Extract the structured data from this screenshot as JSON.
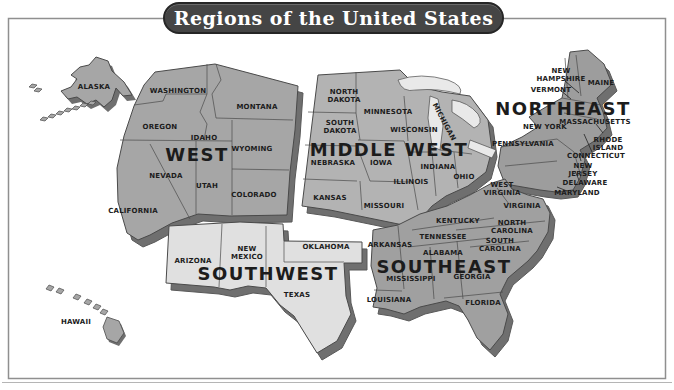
{
  "title": "Regions of the United States",
  "colors": {
    "background": "#ffffff",
    "frame_border": "#8f8f8f",
    "title_fill": "#454545",
    "title_text": "#ffffff",
    "extrusion": "#6f6f6f",
    "state_border": "#4a4a4a",
    "label_text": "#1c1c1c",
    "lake_fill": "#e9e9e9",
    "callout_line": "#222222"
  },
  "map": {
    "regions": [
      {
        "id": "west",
        "name": "WEST",
        "color": "#a6a6a6",
        "label": {
          "x": 197,
          "y": 154
        },
        "states": [
          {
            "name": "ALASKA",
            "x": 94,
            "y": 87
          },
          {
            "name": "WASHINGTON",
            "x": 178,
            "y": 91
          },
          {
            "name": "MONTANA",
            "x": 257,
            "y": 107
          },
          {
            "name": "OREGON",
            "x": 160,
            "y": 127
          },
          {
            "name": "IDAHO",
            "x": 204,
            "y": 138
          },
          {
            "name": "WYOMING",
            "x": 252,
            "y": 149
          },
          {
            "name": "NEVADA",
            "x": 166,
            "y": 176
          },
          {
            "name": "UTAH",
            "x": 207,
            "y": 186
          },
          {
            "name": "COLORADO",
            "x": 254,
            "y": 195
          },
          {
            "name": "CALIFORNIA",
            "x": 133,
            "y": 211
          },
          {
            "name": "HAWAII",
            "x": 76,
            "y": 322
          }
        ]
      },
      {
        "id": "middle_west",
        "name": "MIDDLE WEST",
        "color": "#b3b3b3",
        "label": {
          "x": 389,
          "y": 149
        },
        "states": [
          {
            "name": "NORTH\nDAKOTA",
            "x": 344,
            "y": 92
          },
          {
            "name": "MINNESOTA",
            "x": 388,
            "y": 112
          },
          {
            "name": "MICHIGAN",
            "x": 444,
            "y": 122,
            "rotate": 62
          },
          {
            "name": "SOUTH\nDAKOTA",
            "x": 340,
            "y": 123
          },
          {
            "name": "WISCONSIN",
            "x": 414,
            "y": 130
          },
          {
            "name": "NEBRASKA",
            "x": 333,
            "y": 163
          },
          {
            "name": "IOWA",
            "x": 381,
            "y": 163
          },
          {
            "name": "INDIANA",
            "x": 438,
            "y": 167
          },
          {
            "name": "OHIO",
            "x": 464,
            "y": 177
          },
          {
            "name": "ILLINOIS",
            "x": 411,
            "y": 182
          },
          {
            "name": "KANSAS",
            "x": 330,
            "y": 198
          },
          {
            "name": "MISSOURI",
            "x": 384,
            "y": 206
          }
        ]
      },
      {
        "id": "northeast",
        "name": "NORTHEAST",
        "color": "#9d9d9d",
        "label": {
          "x": 563,
          "y": 108
        },
        "states": [
          {
            "name": "NEW\nHAMPSHIRE",
            "x": 561,
            "y": 71
          },
          {
            "name": "MAINE",
            "x": 601,
            "y": 83
          },
          {
            "name": "VERMONT",
            "x": 551,
            "y": 90
          },
          {
            "name": "MASSACHUSETTS",
            "x": 595,
            "y": 122
          },
          {
            "name": "NEW YORK",
            "x": 545,
            "y": 127
          },
          {
            "name": "PENNSYLVANIA",
            "x": 523,
            "y": 144
          },
          {
            "name": "RHODE\nISLAND",
            "x": 608,
            "y": 140
          },
          {
            "name": "CONNECTICUT",
            "x": 596,
            "y": 156
          },
          {
            "name": "NEW\nJERSEY",
            "x": 583,
            "y": 166
          },
          {
            "name": "DELAWARE",
            "x": 585,
            "y": 183
          },
          {
            "name": "MARYLAND",
            "x": 577,
            "y": 193
          }
        ]
      },
      {
        "id": "southwest",
        "name": "SOUTHWEST",
        "color": "#e0e0e0",
        "label": {
          "x": 268,
          "y": 273
        },
        "states": [
          {
            "name": "ARIZONA",
            "x": 193,
            "y": 261
          },
          {
            "name": "NEW\nMEXICO",
            "x": 247,
            "y": 249
          },
          {
            "name": "OKLAHOMA",
            "x": 326,
            "y": 247
          },
          {
            "name": "TEXAS",
            "x": 297,
            "y": 295
          }
        ]
      },
      {
        "id": "southeast",
        "name": "SOUTHEAST",
        "color": "#a0a0a0",
        "label": {
          "x": 444,
          "y": 266
        },
        "states": [
          {
            "name": "WEST\nVIRGINIA",
            "x": 502,
            "y": 185
          },
          {
            "name": "VIRGINIA",
            "x": 522,
            "y": 206
          },
          {
            "name": "KENTUCKY",
            "x": 458,
            "y": 221
          },
          {
            "name": "NORTH\nCAROLINA",
            "x": 512,
            "y": 223
          },
          {
            "name": "TENNESSEE",
            "x": 443,
            "y": 237
          },
          {
            "name": "SOUTH\nCAROLINA",
            "x": 500,
            "y": 241
          },
          {
            "name": "ARKANSAS",
            "x": 390,
            "y": 245
          },
          {
            "name": "ALABAMA",
            "x": 443,
            "y": 253
          },
          {
            "name": "GEORGIA",
            "x": 472,
            "y": 277
          },
          {
            "name": "MISSISSIPPI",
            "x": 411,
            "y": 279
          },
          {
            "name": "LOUISIANA",
            "x": 389,
            "y": 300
          },
          {
            "name": "FLORIDA",
            "x": 483,
            "y": 303
          }
        ]
      }
    ]
  }
}
